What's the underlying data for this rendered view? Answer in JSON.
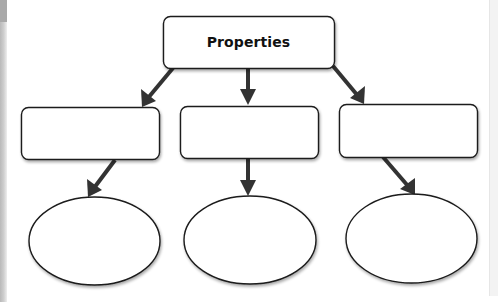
{
  "diagram": {
    "type": "hierarchy",
    "root": {
      "label": "Properties",
      "shape": "rounded-rectangle"
    },
    "level1": [
      {
        "label": "",
        "shape": "rounded-rectangle"
      },
      {
        "label": "",
        "shape": "rounded-rectangle"
      },
      {
        "label": "",
        "shape": "rounded-rectangle"
      }
    ],
    "level2": [
      {
        "label": "",
        "shape": "ellipse"
      },
      {
        "label": "",
        "shape": "ellipse"
      },
      {
        "label": "",
        "shape": "ellipse"
      }
    ],
    "edges": [
      {
        "from": "root",
        "to": "level1.0"
      },
      {
        "from": "root",
        "to": "level1.1"
      },
      {
        "from": "root",
        "to": "level1.2"
      },
      {
        "from": "level1.0",
        "to": "level2.0"
      },
      {
        "from": "level1.1",
        "to": "level2.1"
      },
      {
        "from": "level1.2",
        "to": "level2.2"
      }
    ],
    "colors": {
      "stroke": "#1a1a1a",
      "arrow": "#333333",
      "fill": "#ffffff",
      "shadow": "#9a9a9a"
    }
  }
}
